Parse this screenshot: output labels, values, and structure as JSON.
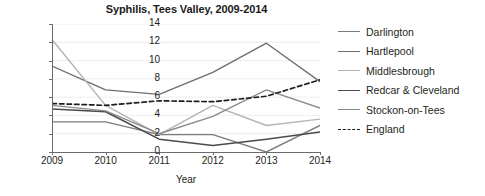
{
  "chart_data": {
    "type": "line",
    "title": "Syphilis, Tees Valley, 2009-2014",
    "xlabel": "Year",
    "ylabel": "Rate per 100 000 population",
    "x": [
      2009,
      2010,
      2011,
      2012,
      2013,
      2014
    ],
    "xtick_labels": [
      "2009",
      "2010",
      "2011",
      "2012",
      "2013",
      "2014"
    ],
    "ytick_labels": [
      "0",
      "2",
      "4",
      "6",
      "8",
      "10",
      "12",
      "14"
    ],
    "ylim": [
      0,
      14
    ],
    "xlim": [
      2009,
      2014
    ],
    "grid": "horizontal",
    "legend_position": "right",
    "series": [
      {
        "name": "Darlington",
        "values": [
          3.3,
          3.3,
          1.9,
          1.9,
          0.0,
          2.9
        ],
        "color": "#7c7c7c",
        "width": 1.4,
        "dash": "solid"
      },
      {
        "name": "Hartlepool",
        "values": [
          9.4,
          6.8,
          6.3,
          8.7,
          11.9,
          7.7
        ],
        "color": "#6e6e6e",
        "width": 1.4,
        "dash": "solid"
      },
      {
        "name": "Middlesbrough",
        "values": [
          12.3,
          5.1,
          1.9,
          5.1,
          2.9,
          3.6
        ],
        "color": "#b4b4b4",
        "width": 1.4,
        "dash": "solid"
      },
      {
        "name": "Redcar & Cleveland",
        "values": [
          4.7,
          4.4,
          1.4,
          0.7,
          1.4,
          2.2
        ],
        "color": "#4a4a4a",
        "width": 1.5,
        "dash": "solid"
      },
      {
        "name": "Stockon-on-Tees",
        "values": [
          5.1,
          4.5,
          2.0,
          3.9,
          6.8,
          4.8
        ],
        "color": "#8a8a8a",
        "width": 1.4,
        "dash": "solid"
      },
      {
        "name": "England",
        "values": [
          5.3,
          5.1,
          5.6,
          5.5,
          6.1,
          7.9
        ],
        "color": "#1f1f1f",
        "width": 1.7,
        "dash": "dashed"
      }
    ]
  },
  "axis": {
    "grid_color": "#ededf2",
    "axis_line_color": "#6b6b6b"
  }
}
